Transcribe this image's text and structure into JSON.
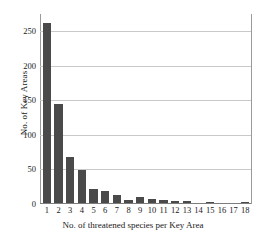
{
  "chart_data": {
    "type": "bar",
    "title": "",
    "subtitle": "",
    "xlabel": "No. of threatened species per Key Area",
    "ylabel": "No. of Key Areas",
    "categories": [
      "1",
      "2",
      "3",
      "4",
      "5",
      "6",
      "7",
      "8",
      "9",
      "10",
      "11",
      "12",
      "13",
      "14",
      "15",
      "16",
      "17",
      "18"
    ],
    "values": [
      261,
      143,
      66,
      48,
      20,
      17,
      12,
      5,
      8,
      6,
      4,
      3,
      3,
      0,
      1,
      0,
      0,
      1
    ],
    "xlim": [
      0.5,
      18.5
    ],
    "ylim": [
      0,
      275
    ],
    "yticks": [
      0,
      50,
      100,
      150,
      200,
      250
    ],
    "ytick_labels": [
      "0",
      "50",
      "100",
      "150",
      "200",
      "250"
    ],
    "grid": "horizontal",
    "legend": "none",
    "bar_color": "#4a4a4a",
    "grid_color": "#c9c9c9",
    "axis_color": "#9a9a9a",
    "background": "#ffffff"
  }
}
